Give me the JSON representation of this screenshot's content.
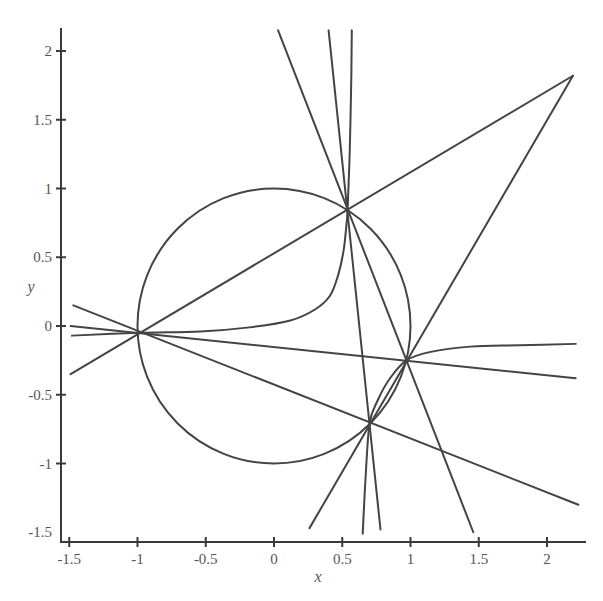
{
  "chart_data": {
    "type": "line",
    "title": "",
    "xlabel": "x",
    "ylabel": "y",
    "xlim": [
      -1.5,
      2.25
    ],
    "ylim": [
      -1.5,
      2.15
    ],
    "grid": false,
    "legend": null,
    "x_ticks": [
      -1.5,
      -1,
      -0.5,
      0,
      0.5,
      1,
      1.5,
      2
    ],
    "x_tick_labels": [
      "-1.5",
      "-1",
      "-0.5",
      "0",
      "0.5",
      "1",
      "1.5",
      "2"
    ],
    "y_ticks": [
      -1.5,
      -1,
      -0.5,
      0,
      0.5,
      1,
      1.5,
      2
    ],
    "y_tick_labels": [
      "-1.5",
      "-1",
      "-0.5",
      "0",
      "0.5",
      "1",
      "1.5",
      "2"
    ],
    "points": {
      "A": [
        -0.99,
        -0.05
      ],
      "B": [
        0.54,
        0.86
      ],
      "C": [
        0.97,
        -0.25
      ],
      "D": [
        0.7,
        -0.71
      ],
      "E": [
        2.19,
        1.82
      ]
    },
    "series": [
      {
        "name": "unit circle",
        "kind": "circle",
        "center": [
          0,
          0
        ],
        "radius": 1
      },
      {
        "name": "line A-B-E",
        "kind": "line",
        "x": [
          -1.49,
          2.19
        ],
        "y": [
          -0.35,
          1.82
        ]
      },
      {
        "name": "line E-C-D",
        "kind": "line",
        "x": [
          2.19,
          0.26
        ],
        "y": [
          1.82,
          -1.47
        ]
      },
      {
        "name": "line A-D",
        "kind": "line",
        "x": [
          -1.47,
          2.23
        ],
        "y": [
          0.15,
          -1.3
        ]
      },
      {
        "name": "line A-C",
        "kind": "line",
        "x": [
          -1.49,
          2.21
        ],
        "y": [
          0.0,
          -0.38
        ]
      },
      {
        "name": "line B-C",
        "kind": "line",
        "x": [
          0.03,
          1.46
        ],
        "y": [
          2.15,
          -1.5
        ]
      },
      {
        "name": "line B-D",
        "kind": "line",
        "x": [
          0.4,
          0.78
        ],
        "y": [
          2.15,
          -1.48
        ]
      },
      {
        "name": "curve branch 1 (through A and B)",
        "kind": "curve",
        "x": [
          -1.48,
          -0.99,
          -0.54,
          -0.18,
          0.12,
          0.3,
          0.41,
          0.47,
          0.51,
          0.53,
          0.54,
          0.555,
          0.566,
          0.57
        ],
        "y": [
          -0.07,
          -0.05,
          -0.04,
          -0.01,
          0.04,
          0.12,
          0.22,
          0.37,
          0.55,
          0.73,
          0.86,
          1.28,
          1.79,
          2.15
        ]
      },
      {
        "name": "curve branch 2 (through D and C)",
        "kind": "curve",
        "x": [
          0.65,
          0.67,
          0.7,
          0.76,
          0.85,
          0.97,
          1.14,
          1.44,
          1.8,
          2.21
        ],
        "y": [
          -1.51,
          -1.12,
          -0.71,
          -0.54,
          -0.38,
          -0.25,
          -0.19,
          -0.15,
          -0.14,
          -0.13
        ]
      }
    ]
  }
}
